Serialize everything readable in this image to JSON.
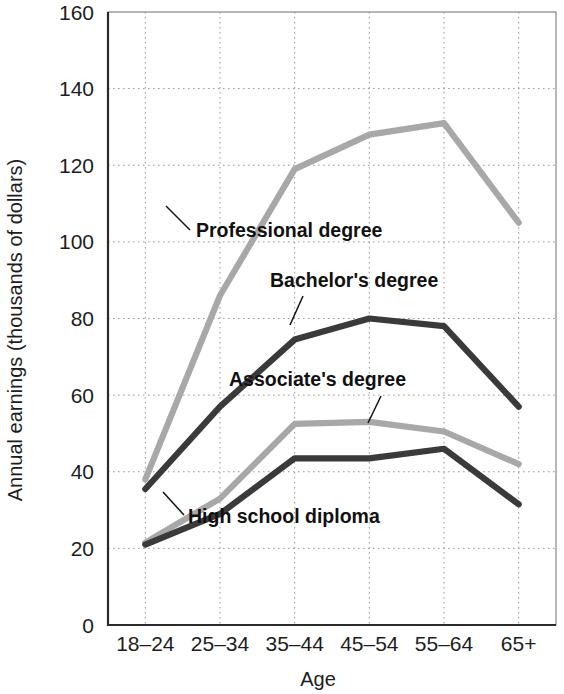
{
  "chart_data": {
    "type": "line",
    "title": "",
    "xlabel": "Age",
    "ylabel": "Annual earnings (thousands of dollars)",
    "categories": [
      "18–24",
      "25–34",
      "35–44",
      "45–54",
      "55–64",
      "65+"
    ],
    "ylim": [
      0,
      160
    ],
    "yticks": [
      0,
      20,
      40,
      60,
      80,
      100,
      120,
      140,
      160
    ],
    "ytick_labels": [
      "0",
      "20",
      "40",
      "60",
      "80",
      "100",
      "120",
      "140",
      "160"
    ],
    "grid": true,
    "legend_position": "inline-annotations",
    "series": [
      {
        "name": "Professional degree",
        "color": "#a8a8a8",
        "values": [
          38,
          86,
          119,
          128,
          131,
          105
        ]
      },
      {
        "name": "Bachelor's degree",
        "color": "#3a3a3a",
        "values": [
          35.5,
          57,
          74.5,
          80,
          78,
          57
        ]
      },
      {
        "name": "Associate's degree",
        "color": "#a8a8a8",
        "values": [
          21.5,
          33,
          52.5,
          53,
          50.5,
          42
        ]
      },
      {
        "name": "High school diploma",
        "color": "#3a3a3a",
        "values": [
          21,
          29,
          43.5,
          43.5,
          46,
          31.5
        ]
      }
    ],
    "annotations": [
      {
        "text": "Professional degree",
        "label_x": 196,
        "label_y": 237,
        "anchor": "start",
        "leader_from_x": 190,
        "leader_from_y": 230,
        "leader_to_x": 166,
        "leader_to_y": 206
      },
      {
        "text": "Bachelor's degree",
        "label_x": 270,
        "label_y": 287,
        "anchor": "start",
        "leader_from_x": 303,
        "leader_from_y": 296,
        "leader_to_x": 290,
        "leader_to_y": 325
      },
      {
        "text": "Associate's degree",
        "label_x": 229,
        "label_y": 386,
        "anchor": "start",
        "leader_from_x": 381,
        "leader_from_y": 396,
        "leader_to_x": 368,
        "leader_to_y": 423
      },
      {
        "text": "High school diploma",
        "label_x": 188,
        "label_y": 523,
        "anchor": "start",
        "leader_from_x": 184,
        "leader_from_y": 515,
        "leader_to_x": 163,
        "leader_to_y": 492
      }
    ]
  },
  "axes": {
    "x_title": "Age",
    "y_title": "Annual earnings (thousands of dollars)"
  }
}
